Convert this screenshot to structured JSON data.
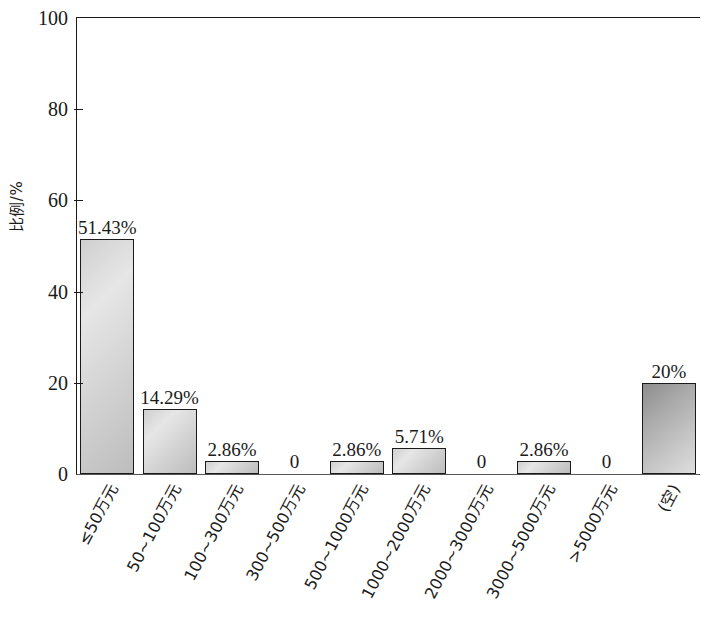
{
  "chart_data": {
    "type": "bar",
    "title": "",
    "subtitle": "",
    "xlabel": "",
    "ylabel": "比例/%",
    "ylim": [
      0,
      100
    ],
    "yticks": [
      0,
      20,
      40,
      60,
      80,
      100
    ],
    "ytick_labels": [
      "0",
      "20",
      "40",
      "60",
      "80",
      "100"
    ],
    "grid": false,
    "legend": null,
    "categories": [
      "≤50万元",
      "50~100万元",
      "100~300万元",
      "300~500万元",
      "500~1000万元",
      "1000~2000万元",
      "2000~3000万元",
      "3000~5000万元",
      ">5000万元",
      "(空)"
    ],
    "values": [
      51.43,
      14.29,
      2.86,
      0,
      2.86,
      5.71,
      0,
      2.86,
      0,
      20
    ],
    "data_labels": [
      "51.43%",
      "14.29%",
      "2.86%",
      "0",
      "2.86%",
      "5.71%",
      "0",
      "2.86%",
      "0",
      "20%"
    ],
    "bar_styles": [
      "light",
      "light",
      "light",
      "none",
      "light",
      "light",
      "none",
      "light",
      "none",
      "dark"
    ],
    "colors": {
      "bar_light_top": "#e6e6e6",
      "bar_light_bottom": "#bdbdbd",
      "bar_dark_top": "#8d8d8d",
      "bar_dark_bottom": "#dedede",
      "bar_outline": "#1a1a1a",
      "axis": "#1a1a1a",
      "background": "#ffffff",
      "text": "#1a1a1a"
    }
  }
}
